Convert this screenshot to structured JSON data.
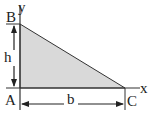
{
  "diagram": {
    "type": "right-triangle",
    "labels": {
      "y_axis": "y",
      "x_axis": "x",
      "vertex_top": "B",
      "vertex_origin": "A",
      "vertex_right": "C",
      "height": "h",
      "base": "b"
    },
    "colors": {
      "fill": "#d9d9d9",
      "stroke": "#333333"
    }
  }
}
